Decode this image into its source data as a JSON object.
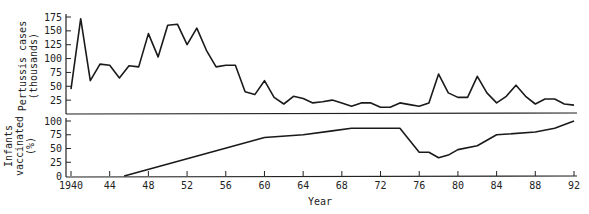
{
  "chart_data": [
    {
      "type": "line",
      "title": "",
      "ylabel": "Pertussis cases (thousands)",
      "ylabel_lines": [
        "Pertussis cases",
        "(thousands)"
      ],
      "xlabel": "",
      "ylim": [
        0,
        175
      ],
      "yticks": [
        25,
        50,
        75,
        100,
        125,
        150,
        175
      ],
      "grid": false,
      "x": [
        1940,
        1941,
        1942,
        1943,
        1944,
        1945,
        1946,
        1947,
        1948,
        1949,
        1950,
        1951,
        1952,
        1953,
        1954,
        1955,
        1956,
        1957,
        1958,
        1959,
        1960,
        1961,
        1962,
        1963,
        1964,
        1965,
        1966,
        1967,
        1968,
        1969,
        1970,
        1971,
        1972,
        1973,
        1974,
        1975,
        1976,
        1977,
        1978,
        1979,
        1980,
        1981,
        1982,
        1983,
        1984,
        1985,
        1986,
        1987,
        1988,
        1989,
        1990,
        1991,
        1992
      ],
      "values": [
        45,
        172,
        60,
        90,
        88,
        65,
        87,
        85,
        145,
        103,
        160,
        162,
        125,
        155,
        115,
        85,
        88,
        88,
        40,
        35,
        60,
        30,
        18,
        32,
        28,
        20,
        22,
        25,
        20,
        14,
        20,
        20,
        12,
        12,
        20,
        17,
        14,
        20,
        72,
        38,
        30,
        30,
        68,
        38,
        20,
        32,
        52,
        32,
        18,
        27,
        27,
        18,
        16
      ]
    },
    {
      "type": "line",
      "title": "",
      "ylabel": "Infants vaccinated (%)",
      "ylabel_lines": [
        "Infants",
        "vaccinated",
        "(%)"
      ],
      "xlabel": "Year",
      "ylim": [
        0,
        100
      ],
      "yticks": [
        0,
        25,
        50,
        75,
        100
      ],
      "grid": false,
      "x": [
        1945.5,
        1960,
        1964,
        1967,
        1969,
        1974,
        1976,
        1977,
        1978,
        1979,
        1980,
        1982,
        1984,
        1988,
        1990,
        1992
      ],
      "values": [
        0,
        70,
        75,
        82,
        87,
        87,
        43,
        43,
        33,
        38,
        48,
        55,
        75,
        80,
        87,
        100
      ]
    }
  ],
  "x_axis": {
    "label": "Year",
    "range": [
      1940,
      1992
    ],
    "ticks": [
      1940,
      1944,
      1948,
      1952,
      1956,
      1960,
      1964,
      1968,
      1972,
      1976,
      1980,
      1984,
      1988,
      1992
    ],
    "tick_labels": [
      "1940",
      "44",
      "48",
      "52",
      "56",
      "60",
      "64",
      "68",
      "72",
      "76",
      "80",
      "84",
      "88",
      "92"
    ]
  }
}
